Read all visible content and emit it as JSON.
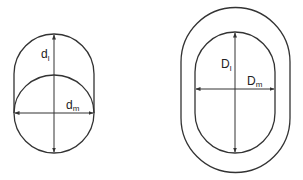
{
  "figures": [
    {
      "id": "left",
      "labels": {
        "vertical": {
          "main": "d",
          "sub": "l"
        },
        "horizontal": {
          "main": "d",
          "sub": "m"
        }
      }
    },
    {
      "id": "right",
      "labels": {
        "vertical": {
          "main": "D",
          "sub": "l"
        },
        "horizontal": {
          "main": "D",
          "sub": "m"
        }
      }
    }
  ]
}
